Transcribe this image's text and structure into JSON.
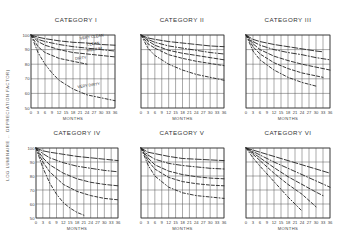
{
  "figure": {
    "y_axis_label_fragments": [
      "LOG LUMINAIRE",
      "DEPRECIATION FACTOR)"
    ],
    "y_axis_label_note": "rotated label at left margin is only partially legible; middle words not resolved",
    "x_axis_label": "MONTHS"
  },
  "chart_data": [
    {
      "type": "line",
      "title": "CATEGORY I",
      "xlabel": "MONTHS",
      "ylabel": "",
      "xlim": [
        0,
        36
      ],
      "ylim": [
        50,
        100
      ],
      "grid": true,
      "x_ticks": [
        0,
        3,
        6,
        9,
        12,
        15,
        18,
        21,
        24,
        27,
        30,
        33,
        36
      ],
      "y_ticks": [
        100,
        90,
        80,
        70,
        60,
        50
      ],
      "show_y_tick_labels": true,
      "annotations": [
        "VERY CLEAN",
        "CLEAN",
        "MEDIUM",
        "DIRTY",
        "VERY DIRTY"
      ],
      "series": [
        {
          "name": "VERY CLEAN",
          "x": [
            0,
            3,
            6,
            12,
            18,
            24,
            30,
            36
          ],
          "values": [
            100,
            98.5,
            97.5,
            96,
            95,
            94.5,
            93.5,
            93
          ]
        },
        {
          "name": "CLEAN",
          "x": [
            0,
            3,
            6,
            12,
            18,
            24,
            30,
            36
          ],
          "values": [
            100,
            97,
            95.5,
            93.5,
            92,
            91,
            90,
            89
          ]
        },
        {
          "name": "MEDIUM",
          "x": [
            0,
            3,
            6,
            12,
            18,
            24,
            30,
            36
          ],
          "values": [
            100,
            95.5,
            93,
            90,
            88,
            87,
            86,
            85
          ]
        },
        {
          "name": "DIRTY",
          "x": [
            0,
            3,
            6,
            12,
            18,
            24
          ],
          "values": [
            100,
            92,
            88,
            84,
            82,
            80
          ]
        },
        {
          "name": "VERY DIRTY",
          "x": [
            0,
            3,
            6,
            9,
            12,
            18,
            24,
            30,
            36
          ],
          "values": [
            100,
            88,
            80,
            74,
            69,
            63,
            59,
            57,
            55
          ]
        }
      ]
    },
    {
      "type": "line",
      "title": "CATEGORY II",
      "xlabel": "MONTHS",
      "xlim": [
        0,
        36
      ],
      "ylim": [
        50,
        100
      ],
      "grid": true,
      "x_ticks": [
        0,
        3,
        6,
        9,
        12,
        15,
        18,
        21,
        24,
        27,
        30,
        33,
        36
      ],
      "y_ticks": [
        100,
        90,
        80,
        70,
        60,
        50
      ],
      "show_y_tick_labels": false,
      "series": [
        {
          "name": "VERY CLEAN",
          "x": [
            0,
            3,
            6,
            12,
            18,
            24,
            30,
            36
          ],
          "values": [
            100,
            98,
            97,
            95.5,
            94.5,
            93.5,
            92.5,
            92
          ]
        },
        {
          "name": "CLEAN",
          "x": [
            0,
            3,
            6,
            12,
            18,
            24,
            30,
            36
          ],
          "values": [
            100,
            97,
            95,
            92.5,
            91,
            89.5,
            88,
            87
          ]
        },
        {
          "name": "MEDIUM",
          "x": [
            0,
            3,
            6,
            12,
            18,
            24,
            30,
            36
          ],
          "values": [
            100,
            96,
            93,
            89.5,
            87.5,
            86,
            84.5,
            83
          ]
        },
        {
          "name": "DIRTY",
          "x": [
            0,
            3,
            6,
            12,
            18,
            24,
            30,
            36
          ],
          "values": [
            100,
            94,
            91,
            86.5,
            84,
            82,
            80.5,
            79
          ]
        },
        {
          "name": "VERY DIRTY",
          "x": [
            0,
            3,
            6,
            12,
            18,
            24,
            30,
            36
          ],
          "values": [
            100,
            91,
            86,
            80,
            76,
            73,
            71,
            69
          ]
        }
      ]
    },
    {
      "type": "line",
      "title": "CATEGORY III",
      "xlabel": "MONTHS",
      "xlim": [
        0,
        36
      ],
      "ylim": [
        50,
        100
      ],
      "grid": true,
      "x_ticks": [
        0,
        3,
        6,
        9,
        12,
        15,
        18,
        21,
        24,
        27,
        30,
        33,
        36
      ],
      "y_ticks": [
        100,
        90,
        80,
        70,
        60,
        50
      ],
      "show_y_tick_labels": false,
      "series": [
        {
          "name": "VERY CLEAN",
          "x": [
            0,
            3,
            6,
            12,
            18,
            24,
            30,
            33
          ],
          "values": [
            100,
            97,
            95.5,
            93.5,
            92,
            90.5,
            89,
            88.5
          ]
        },
        {
          "name": "CLEAN",
          "x": [
            0,
            3,
            6,
            12,
            18,
            24,
            30,
            36
          ],
          "values": [
            100,
            95.5,
            93,
            90,
            88,
            86.5,
            84.5,
            83
          ]
        },
        {
          "name": "MEDIUM",
          "x": [
            0,
            3,
            6,
            12,
            18,
            24,
            30,
            36
          ],
          "values": [
            100,
            94,
            90,
            85.5,
            82.5,
            80,
            78,
            76
          ]
        },
        {
          "name": "DIRTY",
          "x": [
            0,
            3,
            6,
            12,
            18,
            24,
            30,
            33
          ],
          "values": [
            100,
            92,
            87,
            81,
            77,
            74,
            72,
            71
          ]
        },
        {
          "name": "VERY DIRTY",
          "x": [
            0,
            3,
            6,
            12,
            18,
            24,
            30
          ],
          "values": [
            100,
            89,
            83,
            76,
            71,
            67.5,
            65
          ]
        }
      ]
    },
    {
      "type": "line",
      "title": "CATEGORY IV",
      "xlabel": "MONTHS",
      "xlim": [
        0,
        36
      ],
      "ylim": [
        50,
        100
      ],
      "grid": true,
      "x_ticks": [
        0,
        3,
        6,
        9,
        12,
        15,
        18,
        21,
        24,
        27,
        30,
        33,
        36
      ],
      "y_ticks": [
        100,
        90,
        80,
        70,
        60,
        50
      ],
      "show_y_tick_labels": true,
      "series": [
        {
          "name": "VERY CLEAN",
          "x": [
            0,
            3,
            6,
            12,
            18,
            24,
            30,
            36
          ],
          "values": [
            100,
            98,
            97,
            95.5,
            94,
            93,
            92,
            91
          ]
        },
        {
          "name": "CLEAN",
          "x": [
            0,
            3,
            6,
            12,
            18,
            24,
            30,
            36
          ],
          "values": [
            100,
            96,
            93,
            89.5,
            87,
            85.5,
            84,
            83
          ]
        },
        {
          "name": "MEDIUM",
          "x": [
            0,
            3,
            6,
            12,
            18,
            24,
            30,
            36
          ],
          "values": [
            100,
            93,
            88,
            82,
            78,
            75.5,
            74,
            73
          ]
        },
        {
          "name": "DIRTY",
          "x": [
            0,
            3,
            6,
            12,
            18,
            24,
            30,
            36
          ],
          "values": [
            100,
            90,
            83,
            74,
            69,
            66,
            64,
            63
          ]
        },
        {
          "name": "VERY DIRTY",
          "x": [
            0,
            3,
            6,
            9,
            12,
            15,
            18,
            21
          ],
          "values": [
            100,
            86,
            75,
            67,
            61,
            57,
            54,
            52
          ]
        }
      ]
    },
    {
      "type": "line",
      "title": "CATEGORY V",
      "xlabel": "MONTHS",
      "xlim": [
        0,
        36
      ],
      "ylim": [
        50,
        100
      ],
      "grid": true,
      "x_ticks": [
        0,
        3,
        6,
        9,
        12,
        15,
        18,
        21,
        24,
        27,
        30,
        33,
        36
      ],
      "y_ticks": [
        100,
        90,
        80,
        70,
        60,
        50
      ],
      "show_y_tick_labels": false,
      "series": [
        {
          "name": "VERY CLEAN",
          "x": [
            0,
            3,
            6,
            12,
            18,
            24,
            30,
            36
          ],
          "values": [
            100,
            97,
            96,
            94,
            92.5,
            92,
            91.5,
            91
          ]
        },
        {
          "name": "CLEAN",
          "x": [
            0,
            3,
            6,
            12,
            18,
            24,
            30,
            36
          ],
          "values": [
            100,
            95,
            92,
            89,
            87.5,
            86.5,
            85.5,
            85
          ]
        },
        {
          "name": "MEDIUM",
          "x": [
            0,
            3,
            6,
            12,
            18,
            24,
            30,
            36
          ],
          "values": [
            100,
            93,
            88,
            83.5,
            81,
            79.5,
            78.5,
            78
          ]
        },
        {
          "name": "DIRTY",
          "x": [
            0,
            3,
            6,
            12,
            18,
            24,
            30,
            36
          ],
          "values": [
            100,
            91,
            85,
            79,
            76,
            74.5,
            73.5,
            73
          ]
        },
        {
          "name": "VERY DIRTY",
          "x": [
            0,
            3,
            6,
            12,
            18,
            24,
            30,
            36
          ],
          "values": [
            100,
            88,
            80,
            72,
            68,
            66,
            65,
            64
          ]
        }
      ]
    },
    {
      "type": "line",
      "title": "CATEGORY VI",
      "xlabel": "MONTHS",
      "xlim": [
        0,
        36
      ],
      "ylim": [
        50,
        100
      ],
      "grid": true,
      "x_ticks": [
        0,
        3,
        6,
        9,
        12,
        15,
        18,
        21,
        24,
        27,
        30,
        33,
        36
      ],
      "y_ticks": [
        100,
        90,
        80,
        70,
        60,
        50
      ],
      "show_y_tick_labels": false,
      "series": [
        {
          "name": "VERY CLEAN",
          "x": [
            0,
            6,
            12,
            18,
            24,
            30,
            36
          ],
          "values": [
            100,
            97,
            94,
            91,
            88,
            85,
            82
          ]
        },
        {
          "name": "CLEAN",
          "x": [
            0,
            6,
            12,
            18,
            24,
            30,
            36
          ],
          "values": [
            100,
            95,
            90,
            85.5,
            81,
            76.5,
            72
          ]
        },
        {
          "name": "MEDIUM",
          "x": [
            0,
            6,
            12,
            18,
            24,
            30,
            33
          ],
          "values": [
            100,
            93,
            86,
            79.5,
            74,
            68.5,
            66
          ]
        },
        {
          "name": "DIRTY",
          "x": [
            0,
            6,
            12,
            18,
            24,
            30
          ],
          "values": [
            100,
            91,
            82,
            74,
            67,
            58
          ]
        },
        {
          "name": "VERY DIRTY",
          "x": [
            0,
            3,
            6,
            12,
            18,
            24
          ],
          "values": [
            100,
            93,
            87,
            76,
            65,
            55
          ]
        }
      ]
    }
  ]
}
